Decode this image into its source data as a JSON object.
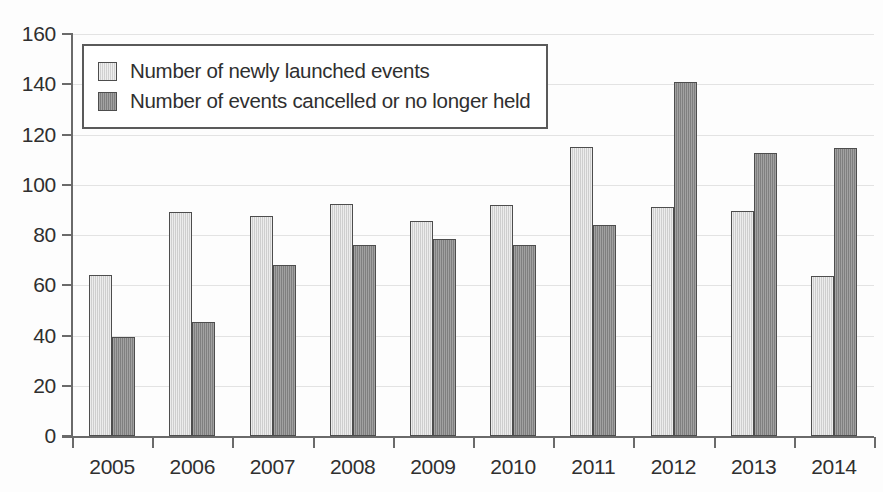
{
  "chart_data": {
    "type": "bar",
    "title": "",
    "subtitle": "",
    "xlabel": "",
    "ylabel": "",
    "categories": [
      "2005",
      "2006",
      "2007",
      "2008",
      "2009",
      "2010",
      "2011",
      "2012",
      "2013",
      "2014"
    ],
    "series": [
      {
        "name": "Number of newly launched events",
        "color": "#d6d6d6",
        "values": [
          64,
          89,
          87.5,
          92.5,
          85.5,
          92,
          115,
          91,
          89.5,
          63.5
        ]
      },
      {
        "name": "Number of events cancelled or no longer held",
        "color": "#8d8d8d",
        "values": [
          39.5,
          45.5,
          68,
          76,
          78.5,
          76,
          84,
          141,
          112.5,
          114.5
        ]
      }
    ],
    "ylim": [
      0,
      160
    ],
    "ytick_step": 20,
    "yticks": [
      "160",
      "140",
      "120",
      "100",
      "80",
      "60",
      "40",
      "20",
      "0"
    ],
    "grid": true,
    "legend_position": "top-left"
  }
}
